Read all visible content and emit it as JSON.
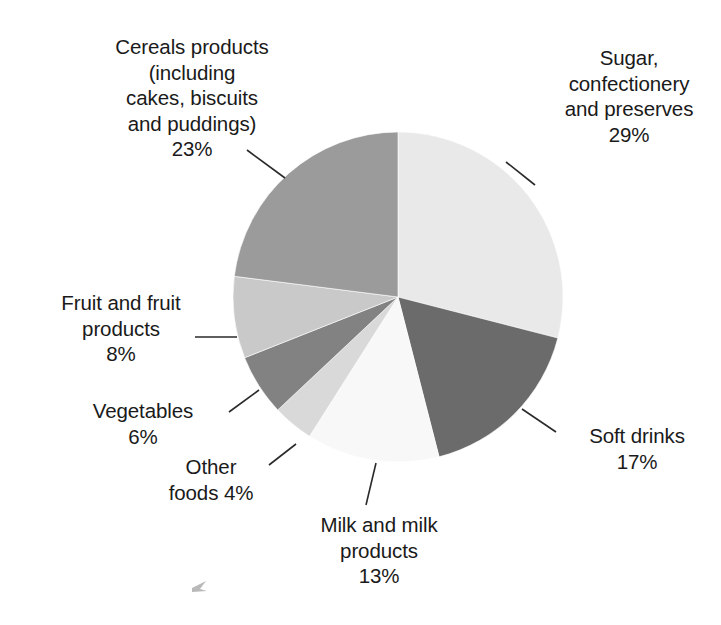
{
  "chart_data": {
    "type": "pie",
    "title": "",
    "subtitle": "",
    "xlabel": "",
    "ylabel": "",
    "legend_position": "none",
    "grid": false,
    "units": "percent",
    "total": 100,
    "center": {
      "x": 398,
      "y": 297
    },
    "radius": 165,
    "start_angle_deg": 0,
    "direction": "clockwise",
    "categories": [
      "Sugar, confectionery and preserves",
      "Soft drinks",
      "Milk and milk products",
      "Other foods",
      "Vegetables",
      "Fruit and fruit products",
      "Cereals products (including cakes, biscuits and puddings)"
    ],
    "values": [
      29,
      17,
      13,
      4,
      6,
      8,
      23
    ],
    "colors": [
      "#e9e9e9",
      "#6b6b6b",
      "#f8f8f8",
      "#d9d9d9",
      "#828282",
      "#c9c9c9",
      "#9b9b9b"
    ],
    "slices": [
      {
        "name": "Sugar, confectionery and preserves",
        "value": 29,
        "value_label": "29%",
        "color": "#e9e9e9",
        "start_deg": 0,
        "end_deg": 104.4
      },
      {
        "name": "Soft drinks",
        "value": 17,
        "value_label": "17%",
        "color": "#6b6b6b",
        "start_deg": 104.4,
        "end_deg": 165.6
      },
      {
        "name": "Milk and milk products",
        "value": 13,
        "value_label": "13%",
        "color": "#f8f8f8",
        "start_deg": 165.6,
        "end_deg": 212.4
      },
      {
        "name": "Other foods",
        "value": 4,
        "value_label": "4%",
        "color": "#d9d9d9",
        "start_deg": 212.4,
        "end_deg": 226.8
      },
      {
        "name": "Vegetables",
        "value": 6,
        "value_label": "6%",
        "color": "#828282",
        "start_deg": 226.8,
        "end_deg": 248.4
      },
      {
        "name": "Fruit and fruit products",
        "value": 8,
        "value_label": "8%",
        "color": "#c9c9c9",
        "start_deg": 248.4,
        "end_deg": 277.2
      },
      {
        "name": "Cereals products (including cakes, biscuits and puddings)",
        "value": 23,
        "value_label": "23%",
        "color": "#9b9b9b",
        "start_deg": 277.2,
        "end_deg": 360
      }
    ]
  },
  "labels": {
    "cereals": "Cereals products\n(including\ncakes, biscuits\nand puddings)\n23%",
    "sugar": "Sugar,\nconfectionery\nand preserves\n29%",
    "soft_drinks": "Soft drinks\n17%",
    "milk": "Milk and milk\nproducts\n13%",
    "fruit": "Fruit and fruit\nproducts\n8%",
    "vegetables": "Vegetables\n6%",
    "other_foods": "Other\nfoods 4%"
  }
}
